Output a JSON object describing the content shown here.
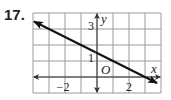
{
  "problem": {
    "number": "17."
  },
  "chart_data": {
    "type": "line",
    "title": "",
    "xlabel": "x",
    "ylabel": "y",
    "origin_label": "O",
    "xlim": [
      -4,
      4
    ],
    "ylim": [
      -1,
      4
    ],
    "grid": true,
    "grid_step": 1,
    "x_tick_labels": [
      {
        "value": -2,
        "label": "−2"
      },
      {
        "value": 2,
        "label": "2"
      }
    ],
    "y_tick_labels": [
      {
        "value": 1,
        "label": "1"
      },
      {
        "value": 3,
        "label": "3"
      }
    ],
    "series": [
      {
        "name": "line",
        "equation": "y = -1/2 x + 3/2",
        "slope": -0.5,
        "intercept": 1.5,
        "points": [
          [
            -4,
            3.5
          ],
          [
            4,
            -0.5
          ]
        ],
        "arrows_both_ends": true
      }
    ],
    "colors": {
      "grid": "#9a9a9a",
      "axis": "#333333",
      "line": "#111111"
    }
  }
}
